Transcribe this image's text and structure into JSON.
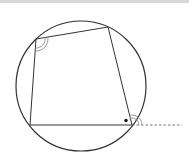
{
  "diagram": {
    "type": "cyclic-quadrilateral",
    "colors": {
      "stroke": "#333333",
      "angle_arc": "#999999",
      "dashed": "#666666",
      "topbar": "#d8d8d8"
    },
    "circle": {
      "cx": 81,
      "cy": 86,
      "r": 65
    },
    "vertices": {
      "top_left": [
        36,
        39
      ],
      "top_right": [
        108,
        27
      ],
      "bottom_right": [
        132,
        125
      ],
      "bottom_left": [
        30,
        125
      ]
    },
    "extension": {
      "from": [
        132,
        125
      ],
      "to": [
        182,
        125
      ],
      "style": "dashed"
    },
    "angle_marks": [
      {
        "vertex": "top_left",
        "kind": "double-arc",
        "label": ""
      },
      {
        "vertex": "bottom_right",
        "kind": "double-arc-exterior",
        "label": ""
      },
      {
        "vertex": "bottom_right",
        "kind": "dot-interior",
        "label": ""
      }
    ]
  }
}
